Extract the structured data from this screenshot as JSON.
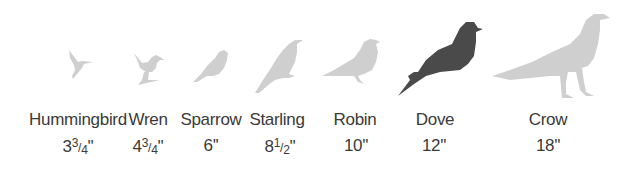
{
  "colors": {
    "highlight": "#4a4a4a",
    "muted": "#cfcfcf",
    "text": "#3a3a3a"
  },
  "birds": [
    {
      "name": "Hummingbird",
      "size_whole": "3",
      "size_num": "3",
      "size_den": "4",
      "size_unit": "''",
      "size_label": "3 3/4\""
    },
    {
      "name": "Wren",
      "size_whole": "4",
      "size_num": "3",
      "size_den": "4",
      "size_unit": "''",
      "size_label": "4 3/4\""
    },
    {
      "name": "Sparrow",
      "size_whole": "6",
      "size_unit": "''",
      "size_label": "6\""
    },
    {
      "name": "Starling",
      "size_whole": "8",
      "size_num": "1",
      "size_den": "2",
      "size_unit": "''",
      "size_label": "8 1/2\""
    },
    {
      "name": "Robin",
      "size_whole": "10",
      "size_unit": "''",
      "size_label": "10\""
    },
    {
      "name": "Dove",
      "size_whole": "12",
      "size_unit": "''",
      "size_label": "12\"",
      "highlighted": true
    },
    {
      "name": "Crow",
      "size_whole": "18",
      "size_unit": "''",
      "size_label": "18\""
    }
  ]
}
